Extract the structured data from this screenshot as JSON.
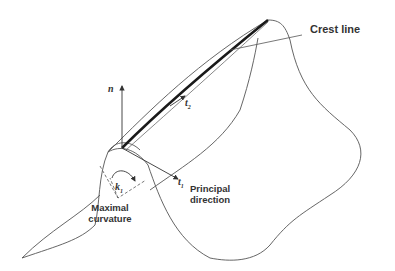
{
  "diagram": {
    "labels": {
      "crest_line": "Crest line",
      "normal_vector": "n",
      "tangent_vector": "t",
      "tangent_subscript": "2",
      "principal_vector": "t",
      "principal_subscript": "1",
      "curvature_symbol": "k",
      "curvature_subscript": "1",
      "principal_direction_line1": "Principal",
      "principal_direction_line2": "direction",
      "maximal_curvature_line1": "Maximal",
      "maximal_curvature_line2": "curvature"
    },
    "colors": {
      "stroke": "#555555",
      "crest": "#1a1a1a",
      "text": "#333333"
    }
  }
}
